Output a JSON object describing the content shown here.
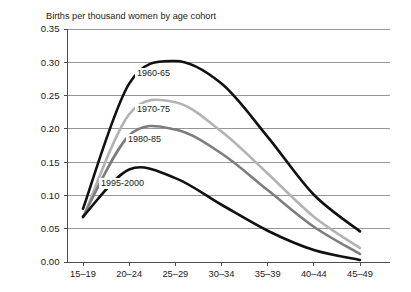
{
  "chart_data": {
    "type": "line",
    "title": "Births per thousand women by age cohort",
    "xlabel": "",
    "ylabel": "",
    "categories": [
      "15–19",
      "20–24",
      "25–29",
      "30–34",
      "35–39",
      "40–44",
      "45–49"
    ],
    "ylim": [
      0.0,
      0.35
    ],
    "yticks": [
      "0.00",
      "0.05",
      "0.10",
      "0.15",
      "0.20",
      "0.25",
      "0.30",
      "0.35"
    ],
    "ytick_values": [
      0.0,
      0.05,
      0.1,
      0.15,
      0.2,
      0.25,
      0.3,
      0.35
    ],
    "grid": true,
    "legend_position": "inline-labels",
    "series": [
      {
        "name": "1960-65",
        "color": "#111111",
        "width": 2.6,
        "values": [
          0.08,
          0.268,
          0.302,
          0.268,
          0.188,
          0.101,
          0.046
        ]
      },
      {
        "name": "1970-75",
        "color": "#b3b3b3",
        "width": 2.6,
        "values": [
          0.066,
          0.222,
          0.24,
          0.196,
          0.133,
          0.068,
          0.021
        ]
      },
      {
        "name": "1980-85",
        "color": "#7d7d7d",
        "width": 2.6,
        "values": [
          0.068,
          0.19,
          0.199,
          0.163,
          0.108,
          0.053,
          0.012
        ]
      },
      {
        "name": "1995-2000",
        "color": "#111111",
        "width": 2.6,
        "values": [
          0.068,
          0.139,
          0.126,
          0.086,
          0.047,
          0.018,
          0.003
        ]
      }
    ]
  }
}
